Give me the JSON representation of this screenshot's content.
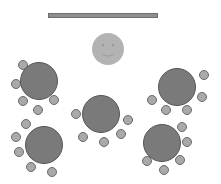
{
  "colors": {
    "background": "#ffffff",
    "stage_bar": "#8e8e8e",
    "host": "#b3b3b3",
    "table": "#7a7a7a",
    "chair": "#a9a9a9",
    "outline": "#5a5a5a"
  },
  "stage": {
    "x": 48,
    "y": 13,
    "width": 110,
    "height": 5
  },
  "host": {
    "cx": 108,
    "cy": 49,
    "r": 16,
    "icon": "smiley-face-icon"
  },
  "tables": [
    {
      "id": "table-1",
      "cx": 39,
      "cy": 81,
      "r": 19,
      "chairs": [
        [
          23,
          65
        ],
        [
          16,
          84
        ],
        [
          23,
          101
        ],
        [
          38,
          110
        ],
        [
          54,
          100
        ]
      ]
    },
    {
      "id": "table-2",
      "cx": 177,
      "cy": 87,
      "r": 19,
      "chairs": [
        [
          204,
          75
        ],
        [
          202,
          97
        ],
        [
          152,
          100
        ],
        [
          166,
          110
        ],
        [
          187,
          110
        ]
      ]
    },
    {
      "id": "table-3",
      "cx": 101,
      "cy": 114,
      "r": 19,
      "chairs": [
        [
          76,
          114
        ],
        [
          83,
          137
        ],
        [
          104,
          142
        ],
        [
          121,
          134
        ],
        [
          128,
          120
        ]
      ]
    },
    {
      "id": "table-4",
      "cx": 44,
      "cy": 145,
      "r": 19,
      "chairs": [
        [
          26,
          124
        ],
        [
          16,
          137
        ],
        [
          19,
          152
        ],
        [
          31,
          167
        ],
        [
          52,
          172
        ]
      ]
    },
    {
      "id": "table-5",
      "cx": 162,
      "cy": 143,
      "r": 19,
      "chairs": [
        [
          182,
          127
        ],
        [
          187,
          142
        ],
        [
          180,
          160
        ],
        [
          147,
          161
        ],
        [
          164,
          170
        ]
      ]
    }
  ],
  "chair_radius": 5
}
